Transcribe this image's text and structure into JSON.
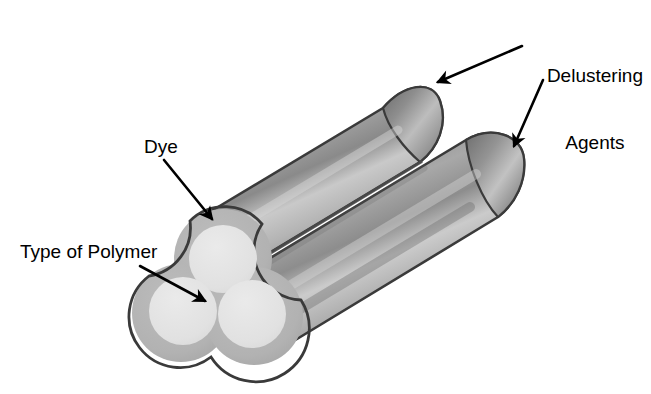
{
  "figure": {
    "background_color": "#ffffff",
    "labels": {
      "delustering_agents": "Delustering\nAgents",
      "delustering_agents_line1": "Delustering",
      "delustering_agents_line2": "Agents",
      "dye": "Dye",
      "type_of_polymer": "Type of Polymer"
    },
    "colors": {
      "outline": "#3a3a3a",
      "dye_ring": "#b0b0b0",
      "polymer_core": "#e2e2e2",
      "fiber_dark": "#6e6e6e",
      "fiber_mid": "#9a9a9a",
      "fiber_light": "#cfcfcf",
      "fiber_shadow": "#5a5a5a",
      "arrow": "#000000",
      "text": "#000000"
    },
    "annotations": [
      {
        "name": "delustering-agents-upper",
        "label": "Delustering Agents",
        "target": "upper cylinder end cap",
        "arrow_from": [
          520,
          48
        ],
        "arrow_to": [
          432,
          83
        ]
      },
      {
        "name": "delustering-agents-lower",
        "label": "Delustering Agents",
        "target": "lower cylinder end cap",
        "arrow_from": [
          540,
          82
        ],
        "arrow_to": [
          513,
          148
        ]
      },
      {
        "name": "dye-annotation",
        "label": "Dye",
        "target": "outer ring of trilobal cross-section",
        "arrow_from": [
          166,
          162
        ],
        "arrow_to": [
          214,
          221
        ]
      },
      {
        "name": "type-of-polymer-annotation",
        "label": "Type of Polymer",
        "target": "light inner core of cross-section",
        "arrow_from": [
          144,
          268
        ],
        "arrow_to": [
          207,
          303
        ]
      }
    ],
    "geometry": {
      "cross_section": {
        "lobes": 3,
        "description": "three overlapping circles forming a clover / trilobal profile",
        "lobe_centers": [
          [
            223,
            258
          ],
          [
            181,
            313
          ],
          [
            253,
            316
          ]
        ],
        "lobe_radius_outer": 49,
        "lobe_radius_inner": 34
      },
      "cylinders": [
        {
          "name": "upper-lobe-body",
          "axis_angle_deg": -31
        },
        {
          "name": "lower-lobe-body",
          "axis_angle_deg": -31
        }
      ]
    }
  }
}
